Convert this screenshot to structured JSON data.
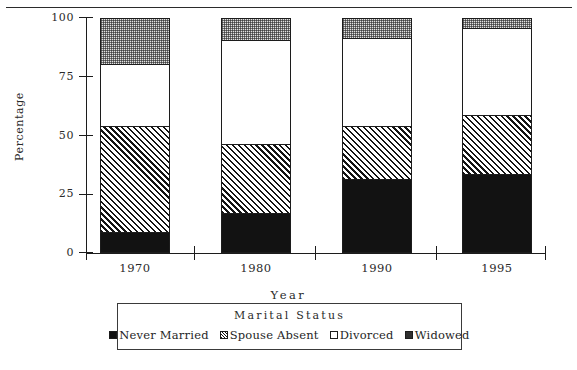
{
  "header": {
    "faint_caption": ""
  },
  "chart_data": {
    "type": "bar",
    "subtype": "stacked-bar-100",
    "title": "",
    "xlabel": "Year",
    "ylabel": "Percentage",
    "categories": [
      "1970",
      "1980",
      "1990",
      "1995"
    ],
    "yticks": [
      0,
      25,
      50,
      75,
      100
    ],
    "ytick_labels": [
      "0",
      "25",
      "50",
      "75",
      "100"
    ],
    "ylim": [
      0,
      100
    ],
    "grid": false,
    "legend_title": "Marital   Status",
    "legend_position": "bottom",
    "series": [
      {
        "name": "Never Married",
        "fill": "solid",
        "values": [
          9.5,
          17.5,
          32.0,
          34.0
        ]
      },
      {
        "name": "Spouse Absent",
        "fill": "hatch",
        "values": [
          45.0,
          29.5,
          22.5,
          25.0
        ]
      },
      {
        "name": "Divorced",
        "fill": "empty",
        "values": [
          26.5,
          44.0,
          37.5,
          37.0
        ]
      },
      {
        "name": "Widowed",
        "fill": "dots",
        "values": [
          19.0,
          9.0,
          8.0,
          4.0
        ]
      }
    ],
    "cumulative_tops": {
      "1970": [
        9.5,
        54.5,
        81.0,
        100.0
      ],
      "1980": [
        17.5,
        47.0,
        91.0,
        100.0
      ],
      "1990": [
        32.0,
        54.5,
        92.0,
        100.0
      ],
      "1995": [
        34.0,
        59.0,
        96.0,
        100.0
      ]
    },
    "colors": {
      "ink": "#1c1c1c",
      "never_married": "#121212",
      "spouse_absent": "#ffffff",
      "divorced": "#ffffff",
      "widowed": "#e2e2e2"
    }
  }
}
